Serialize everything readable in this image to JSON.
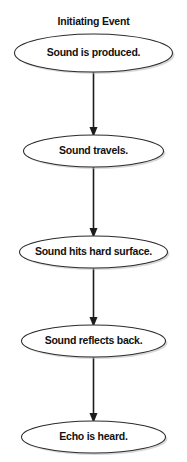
{
  "diagram": {
    "title": "Initiating Event",
    "type": "flowchart",
    "orientation": "vertical",
    "background_color": "#ffffff",
    "node_fill_color": "#ffffff",
    "node_stroke_color": "#2b2b2b",
    "connector_color": "#1c1c1c",
    "text_color": "#111111",
    "node_shape": "ellipse",
    "nodes": [
      {
        "id": "node-1",
        "label": "Sound is produced.",
        "cx": 93.5,
        "cy": 53,
        "rx": 79,
        "ry": 19
      },
      {
        "id": "node-2",
        "label": "Sound travels.",
        "cx": 93.5,
        "cy": 151,
        "rx": 70,
        "ry": 16
      },
      {
        "id": "node-3",
        "label": "Sound hits hard surface.",
        "cx": 93.5,
        "cy": 252,
        "rx": 74,
        "ry": 16
      },
      {
        "id": "node-4",
        "label": "Sound reflects back.",
        "cx": 93.5,
        "cy": 341,
        "rx": 72,
        "ry": 16
      },
      {
        "id": "node-5",
        "label": "Echo is heard.",
        "cx": 93.5,
        "cy": 437,
        "rx": 72,
        "ry": 16
      }
    ],
    "connectors": [
      {
        "id": "connector-1",
        "from": "node-1",
        "to": "node-2",
        "x": 93.5,
        "y_start": 70,
        "y_end": 135,
        "arrowhead": "triangle"
      },
      {
        "id": "connector-2",
        "from": "node-2",
        "to": "node-3",
        "x": 93.5,
        "y_start": 162,
        "y_end": 236,
        "arrowhead": "triangle"
      },
      {
        "id": "connector-3",
        "from": "node-3",
        "to": "node-4",
        "x": 93.5,
        "y_start": 267,
        "y_end": 325,
        "arrowhead": "triangle"
      },
      {
        "id": "connector-4",
        "from": "node-4",
        "to": "node-5",
        "x": 93.5,
        "y_start": 356,
        "y_end": 421,
        "arrowhead": "triangle"
      }
    ]
  }
}
